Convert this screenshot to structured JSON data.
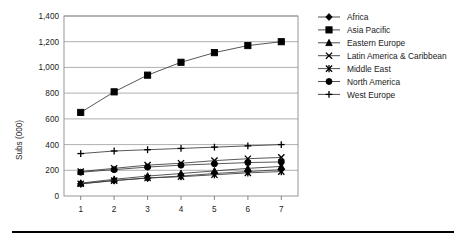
{
  "chart_data": {
    "type": "line",
    "title": "",
    "xlabel": "",
    "ylabel": "Subs (000)",
    "x": [
      1,
      2,
      3,
      4,
      5,
      6,
      7
    ],
    "xtick_labels": [
      "1",
      "2",
      "3",
      "4",
      "5",
      "6",
      "7"
    ],
    "ytick_labels": [
      "0",
      "200",
      "400",
      "600",
      "800",
      "1,000",
      "1,200",
      "1,400"
    ],
    "ytick_values": [
      0,
      200,
      400,
      600,
      800,
      1000,
      1200,
      1400
    ],
    "ylim": [
      0,
      1400
    ],
    "xlim": [
      0.5,
      7.5
    ],
    "grid": "horizontal",
    "legend_position": "right",
    "series": [
      {
        "name": "Africa",
        "marker": "diamond",
        "values": [
          95,
          120,
          140,
          155,
          175,
          190,
          205
        ]
      },
      {
        "name": "Asia Pacific",
        "marker": "square",
        "values": [
          650,
          810,
          940,
          1040,
          1115,
          1170,
          1200
        ]
      },
      {
        "name": "Eastern Europe",
        "marker": "triangle",
        "values": [
          100,
          130,
          155,
          175,
          195,
          215,
          230
        ]
      },
      {
        "name": "Latin America & Caribbean",
        "marker": "x",
        "values": [
          190,
          215,
          240,
          255,
          275,
          290,
          300
        ]
      },
      {
        "name": "Middle East",
        "marker": "star-x",
        "values": [
          95,
          120,
          140,
          150,
          165,
          180,
          190
        ]
      },
      {
        "name": "North America",
        "marker": "circle",
        "values": [
          185,
          205,
          225,
          240,
          250,
          260,
          265
        ]
      },
      {
        "name": "West Europe",
        "marker": "plus",
        "values": [
          330,
          350,
          360,
          370,
          380,
          390,
          400
        ]
      }
    ]
  },
  "legend": {
    "entries": [
      {
        "label": "Africa"
      },
      {
        "label": "Asia Pacific"
      },
      {
        "label": "Eastern Europe"
      },
      {
        "label": "Latin America & Caribbean"
      },
      {
        "label": "Middle East"
      },
      {
        "label": "North America"
      },
      {
        "label": "West Europe"
      }
    ]
  },
  "decoration": {
    "bottom_rule": "horizontal-rule"
  }
}
